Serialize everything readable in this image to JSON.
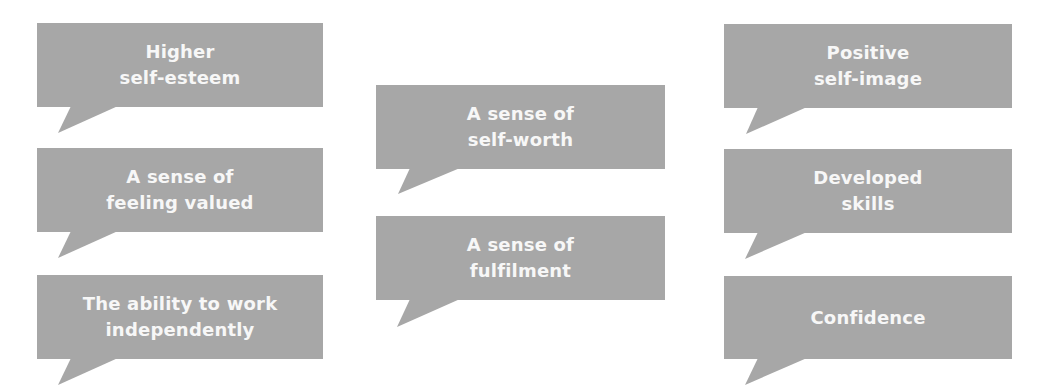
{
  "diagram": {
    "type": "speech-bubble-grid",
    "colors": {
      "bubble_fill": "#a7a7a7",
      "text": "#f7f7f7",
      "background": "#ffffff"
    },
    "columns": [
      {
        "bubbles": [
          {
            "text": "Higher\nself-esteem",
            "box": [
              37,
              23,
              286,
              84
            ],
            "tail": [
              [
                71,
                106
              ],
              [
                118,
                106
              ],
              [
                58,
                133
              ]
            ]
          },
          {
            "text": "A sense of\nfeeling valued",
            "box": [
              37,
              148,
              286,
              84
            ],
            "tail": [
              [
                71,
                231
              ],
              [
                118,
                231
              ],
              [
                58,
                258
              ]
            ]
          },
          {
            "text": "The ability to work\nindependently",
            "box": [
              37,
              275,
              286,
              84
            ],
            "tail": [
              [
                71,
                358
              ],
              [
                118,
                358
              ],
              [
                58,
                385
              ]
            ]
          }
        ]
      },
      {
        "bubbles": [
          {
            "text": "A sense of\nself-worth",
            "box": [
              376,
              85,
              289,
              84
            ],
            "tail": [
              [
                410,
                168
              ],
              [
                460,
                168
              ],
              [
                398,
                194
              ]
            ]
          },
          {
            "text": "A sense of\nfulfilment",
            "box": [
              376,
              216,
              289,
              84
            ],
            "tail": [
              [
                410,
                299
              ],
              [
                460,
                299
              ],
              [
                397,
                327
              ]
            ]
          }
        ]
      },
      {
        "bubbles": [
          {
            "text": "Positive\nself-image",
            "box": [
              724,
              24,
              288,
              84
            ],
            "tail": [
              [
                758,
                107
              ],
              [
                807,
                107
              ],
              [
                746,
                134
              ]
            ]
          },
          {
            "text": "Developed\nskills",
            "box": [
              724,
              149,
              288,
              84
            ],
            "tail": [
              [
                758,
                232
              ],
              [
                807,
                232
              ],
              [
                745,
                259
              ]
            ]
          },
          {
            "text": "Confidence",
            "box": [
              724,
              276,
              288,
              83
            ],
            "tail": [
              [
                758,
                358
              ],
              [
                807,
                358
              ],
              [
                745,
                385
              ]
            ]
          }
        ]
      }
    ]
  }
}
